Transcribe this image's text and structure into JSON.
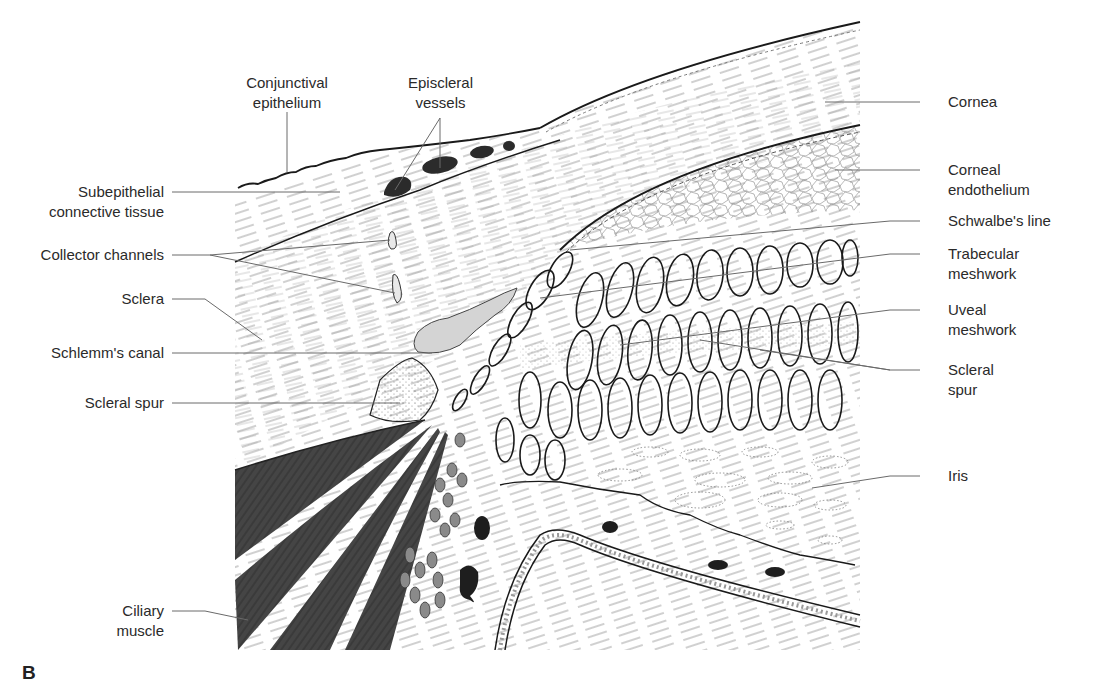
{
  "figure": {
    "panel_letter": "B"
  },
  "labels": {
    "left": [
      {
        "id": "conjunctival_epithelium",
        "line1": "Conjunctival",
        "line2": "epithelium"
      },
      {
        "id": "episcleral_vessels",
        "line1": "Episcleral",
        "line2": "vessels"
      },
      {
        "id": "subepithelial_connective_tissue",
        "line1": "Subepithelial",
        "line2": "connective tissue"
      },
      {
        "id": "collector_channels",
        "line1": "Collector channels"
      },
      {
        "id": "sclera",
        "line1": "Sclera"
      },
      {
        "id": "schlemms_canal",
        "line1": "Schlemm's canal"
      },
      {
        "id": "scleral_spur_left",
        "line1": "Scleral spur"
      },
      {
        "id": "ciliary_muscle",
        "line1": "Ciliary",
        "line2": "muscle"
      }
    ],
    "right": [
      {
        "id": "cornea",
        "line1": "Cornea"
      },
      {
        "id": "corneal_endothelium",
        "line1": "Corneal",
        "line2": "endothelium"
      },
      {
        "id": "schwalbes_line",
        "line1": "Schwalbe's line"
      },
      {
        "id": "trabecular_meshwork",
        "line1": "Trabecular",
        "line2": "meshwork"
      },
      {
        "id": "uveal_meshwork",
        "line1": "Uveal",
        "line2": "meshwork"
      },
      {
        "id": "scleral_spur_right",
        "line1": "Scleral",
        "line2": "spur"
      },
      {
        "id": "iris",
        "line1": "Iris"
      }
    ]
  },
  "colors": {
    "ink": "#1a1a1a",
    "muscle": "#4a4a4a",
    "canal_fill": "#d4d4d4",
    "vessel": "#2b2b2b",
    "pigment_cells": "#8a8a8a",
    "leader": "#6a6a6a",
    "label_text": "#2a2a2a"
  }
}
